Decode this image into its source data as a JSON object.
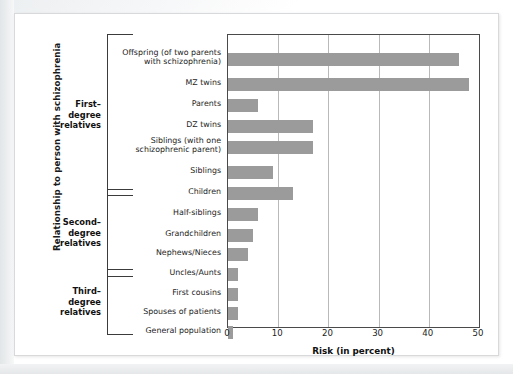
{
  "figure": {
    "ylabel": "Relationship to person with schizophrenia",
    "xlabel": "Risk (in percent)"
  },
  "groups": [
    {
      "name": "first-degree",
      "label_line1": "First–",
      "label_line2": "degree",
      "label_line3": "relatives"
    },
    {
      "name": "second-degree",
      "label_line1": "Second–",
      "label_line2": "degree",
      "label_line3": "relatives"
    },
    {
      "name": "third-degree",
      "label_line1": "Third–",
      "label_line2": "degree",
      "label_line3": "relatives"
    }
  ],
  "chart_data": {
    "type": "bar",
    "orientation": "horizontal",
    "title": "",
    "subtitle": "",
    "xlabel": "Risk (in percent)",
    "ylabel": "Relationship to person with schizophrenia",
    "xlim": [
      0,
      50
    ],
    "ylim": null,
    "grid": "vertical",
    "legend": "none",
    "bar_color": "#9b9b9b",
    "xticks": [
      0,
      10,
      20,
      30,
      40,
      50
    ],
    "xticklabels": [
      "0",
      "10",
      "20",
      "30",
      "40",
      "50"
    ],
    "categories": [
      "Offspring (of two parents\nwith schizophrenia)",
      "MZ twins",
      "Parents",
      "DZ twins",
      "Siblings (with one\nschizophrenic parent)",
      "Siblings",
      "Children",
      "Half-siblings",
      "Grandchildren",
      "Nephews/Nieces",
      "Uncles/Aunts",
      "First cousins",
      "Spouses  of patients",
      "General population"
    ],
    "values": [
      46,
      48,
      6,
      17,
      17,
      9,
      13,
      6,
      5,
      4,
      2,
      2,
      2,
      1
    ],
    "group_assignment": [
      "first-degree",
      "first-degree",
      "first-degree",
      "first-degree",
      "first-degree",
      "first-degree",
      "first-degree",
      "second-degree",
      "second-degree",
      "second-degree",
      "second-degree",
      "third-degree",
      "third-degree",
      "third-degree"
    ]
  },
  "categories_display": [
    {
      "line1": "Offspring (of two parents",
      "line2": "with schizophrenia)"
    },
    {
      "line1": "MZ twins",
      "line2": ""
    },
    {
      "line1": "Parents",
      "line2": ""
    },
    {
      "line1": "DZ twins",
      "line2": ""
    },
    {
      "line1": "Siblings (with one",
      "line2": "schizophrenic parent)"
    },
    {
      "line1": "Siblings",
      "line2": ""
    },
    {
      "line1": "Children",
      "line2": ""
    },
    {
      "line1": "Half-siblings",
      "line2": ""
    },
    {
      "line1": "Grandchildren",
      "line2": ""
    },
    {
      "line1": "Nephews/Nieces",
      "line2": ""
    },
    {
      "line1": "Uncles/Aunts",
      "line2": ""
    },
    {
      "line1": "First cousins",
      "line2": ""
    },
    {
      "line1": "Spouses  of patients",
      "line2": ""
    },
    {
      "line1": "General population",
      "line2": ""
    }
  ]
}
